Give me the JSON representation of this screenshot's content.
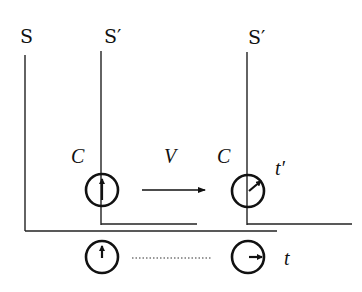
{
  "diagram": {
    "type": "special-relativity-clock-frames",
    "frames": [
      {
        "id": "S",
        "label": "S"
      },
      {
        "id": "S_prime_initial",
        "label": "S′"
      },
      {
        "id": "S_prime_moved",
        "label": "S′"
      }
    ],
    "labels": {
      "clock_c_left": "C",
      "clock_c_right": "C",
      "velocity": "V",
      "moving_time": "t′",
      "rest_time": "t"
    },
    "clocks": [
      {
        "name": "moving-clock-initial",
        "hand": "up"
      },
      {
        "name": "moving-clock-later",
        "hand": "up-right"
      },
      {
        "name": "rest-clock-initial",
        "hand": "up"
      },
      {
        "name": "rest-clock-later",
        "hand": "right"
      }
    ],
    "colors": {
      "stroke": "#111111",
      "background": "#ffffff"
    }
  }
}
